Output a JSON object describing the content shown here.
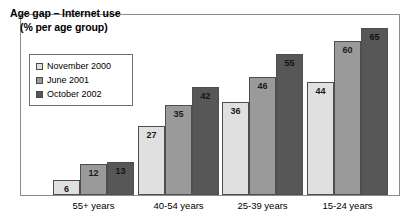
{
  "chart_data": {
    "type": "bar",
    "title": "Age gap – Internet use",
    "subtitle": "(% per age group)",
    "xlabel": "",
    "ylabel": "",
    "ylim": [
      0,
      70
    ],
    "grid": false,
    "legend_position": "top-left",
    "categories": [
      "55+ years",
      "40-54 years",
      "25-39 years",
      "15-24 years"
    ],
    "series": [
      {
        "name": "November 2000",
        "color": "#e0e0e0",
        "values": [
          6,
          27,
          36,
          44
        ]
      },
      {
        "name": "June 2001",
        "color": "#9a9a9a",
        "values": [
          12,
          35,
          46,
          60
        ]
      },
      {
        "name": "October 2002",
        "color": "#575757",
        "values": [
          13,
          42,
          55,
          65
        ]
      }
    ]
  },
  "colors": {
    "series_light": "#e0e0e0",
    "series_medium": "#9a9a9a",
    "series_dark": "#575757",
    "frame": "#8d8d8d",
    "bar_outline": "#4e4e4e",
    "text": "#000000",
    "background": "#ffffff"
  },
  "icons": {
    "legend_swatch": "square-swatch-icon"
  }
}
